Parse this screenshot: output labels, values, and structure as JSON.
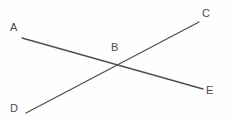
{
  "figure": {
    "type": "geometry-diagram",
    "background_color": "#fefefe",
    "line_color": "#4f4f4f",
    "label_color": "#4a4a4a",
    "line_width": 1.3,
    "width": 233,
    "height": 125,
    "labels": [
      {
        "text": "A",
        "x": 10,
        "y": 22
      },
      {
        "text": "B",
        "x": 111,
        "y": 42
      },
      {
        "text": "C",
        "x": 202,
        "y": 8
      },
      {
        "text": "D",
        "x": 10,
        "y": 103
      },
      {
        "text": "E",
        "x": 206,
        "y": 85
      }
    ],
    "segments": [
      {
        "name": "line-AE",
        "from": "A",
        "to": "E",
        "x1": 22,
        "y1": 38,
        "x2": 203,
        "y2": 89
      },
      {
        "name": "line-DC",
        "from": "D",
        "to": "C",
        "x1": 26,
        "y1": 113,
        "x2": 199,
        "y2": 22
      }
    ],
    "intersection": {
      "name": "B",
      "x": 117,
      "y": 63
    }
  }
}
